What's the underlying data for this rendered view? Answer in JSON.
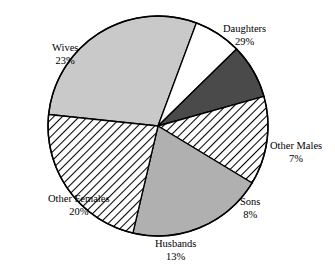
{
  "chart_data": {
    "type": "pie",
    "title": "",
    "subtitle": "",
    "xlabel": "",
    "ylabel": "",
    "legend_position": "none",
    "grid": false,
    "labels_show_percent": true,
    "categories": [
      "Daughters",
      "Other Males",
      "Sons",
      "Husbands",
      "Other Females",
      "Wives"
    ],
    "values": [
      29,
      7,
      8,
      13,
      20,
      23
    ],
    "slices": [
      {
        "name": "Daughters",
        "percent_text": "29%",
        "value": 29,
        "fill": "#c9c9c9",
        "pattern": "solid",
        "start_angle": -84,
        "end_angle": 20.4,
        "label_x": 223,
        "label_y": 23
      },
      {
        "name": "Other Males",
        "percent_text": "7%",
        "value": 7,
        "fill": "#ffffff",
        "pattern": "solid",
        "start_angle": 20.4,
        "end_angle": 45.6,
        "label_x": 270,
        "label_y": 140
      },
      {
        "name": "Sons",
        "percent_text": "8%",
        "value": 8,
        "fill": "#4a4a4a",
        "pattern": "solid",
        "start_angle": 45.6,
        "end_angle": 74.4,
        "label_x": 240,
        "label_y": 196
      },
      {
        "name": "Husbands",
        "percent_text": "13%",
        "value": 13,
        "fill": "#ffffff",
        "pattern": "hatch",
        "start_angle": 74.4,
        "end_angle": 121.2,
        "label_x": 155,
        "label_y": 238
      },
      {
        "name": "Other Females",
        "percent_text": "20%",
        "value": 20,
        "fill": "#b0b0b0",
        "pattern": "solid",
        "start_angle": 121.2,
        "end_angle": 193.2,
        "label_x": 48,
        "label_y": 193
      },
      {
        "name": "Wives",
        "percent_text": "23%",
        "value": 23,
        "fill": "#ffffff",
        "pattern": "hatch",
        "start_angle": 193.2,
        "end_angle": 276,
        "label_x": 52,
        "label_y": 42
      }
    ],
    "geometry": {
      "center_x": 158,
      "center_y": 126,
      "radius": 110
    },
    "colors": {
      "outline": "#000000",
      "background": "#ffffff",
      "text": "#000000",
      "light_gray": "#c9c9c9",
      "medium_gray": "#b0b0b0",
      "dark_gray": "#4a4a4a"
    }
  }
}
